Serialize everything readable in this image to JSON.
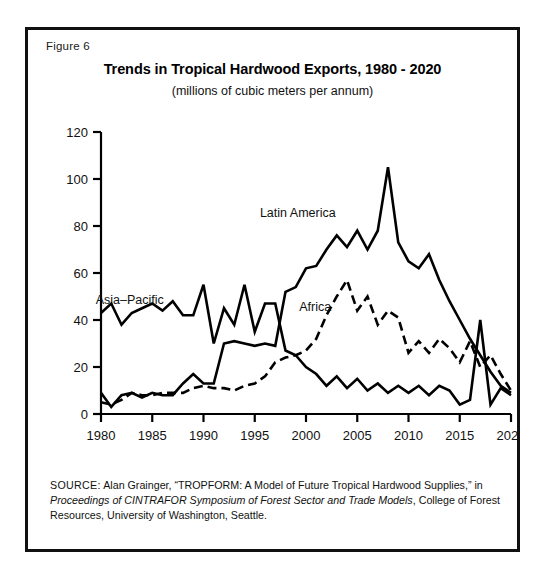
{
  "figure": {
    "number_label": "Figure 6"
  },
  "chart_data": {
    "type": "line",
    "title": "Trends in Tropical Hardwood Exports, 1980 - 2020",
    "subtitle": "(millions of cubic meters per annum)",
    "xlabel": "",
    "ylabel": "",
    "xlim": [
      1980,
      2020
    ],
    "ylim": [
      0,
      120
    ],
    "grid": false,
    "legend_position": "inline-annotations",
    "x_ticks": [
      "1980",
      "1985",
      "1990",
      "1995",
      "2000",
      "2005",
      "2010",
      "2015",
      "2020"
    ],
    "y_ticks": [
      "0",
      "20",
      "40",
      "60",
      "80",
      "100",
      "120"
    ],
    "x": [
      1980,
      1981,
      1982,
      1983,
      1984,
      1985,
      1986,
      1987,
      1988,
      1989,
      1990,
      1991,
      1992,
      1993,
      1994,
      1995,
      1996,
      1997,
      1998,
      1999,
      2000,
      2001,
      2002,
      2003,
      2004,
      2005,
      2006,
      2007,
      2008,
      2009,
      2010,
      2011,
      2012,
      2013,
      2014,
      2015,
      2016,
      2017,
      2018,
      2019,
      2020
    ],
    "series": [
      {
        "name": "Asia-Pacific",
        "label": "Asia–Pacific",
        "style": "solid",
        "values": [
          43,
          47,
          38,
          43,
          45,
          47,
          44,
          48,
          42,
          42,
          55,
          30,
          45,
          38,
          55,
          35,
          47,
          47,
          27,
          25,
          20,
          17,
          12,
          16,
          11,
          15,
          10,
          13,
          9,
          12,
          9,
          12,
          8,
          12,
          10,
          4,
          6,
          40,
          4,
          11,
          8
        ]
      },
      {
        "name": "Latin America",
        "label": "Latin America",
        "style": "solid",
        "values": [
          9,
          3,
          8,
          9,
          7,
          9,
          8,
          8,
          13,
          17,
          13,
          13,
          30,
          31,
          30,
          29,
          30,
          29,
          52,
          54,
          62,
          63,
          70,
          76,
          71,
          78,
          70,
          78,
          105,
          73,
          65,
          62,
          68,
          57,
          48,
          40,
          32,
          25,
          18,
          12,
          9
        ]
      },
      {
        "name": "Africa",
        "label": "Africa",
        "style": "dashed",
        "values": [
          5,
          4,
          6,
          9,
          8,
          8,
          9,
          9,
          9,
          11,
          12,
          11,
          11,
          10,
          12,
          13,
          16,
          22,
          24,
          25,
          27,
          32,
          42,
          50,
          57,
          44,
          50,
          38,
          44,
          41,
          26,
          31,
          26,
          32,
          28,
          22,
          31,
          20,
          25,
          17,
          10
        ]
      }
    ],
    "annotations": [
      {
        "text": "Asia–Pacific",
        "x": 1982.8,
        "y": 47
      },
      {
        "text": "Latin America",
        "x": 1999.2,
        "y": 84
      },
      {
        "text": "Africa",
        "x": 2000.9,
        "y": 44
      }
    ]
  },
  "source": {
    "label": "SOURCE:",
    "part1": "Alan Grainger, “TROPFORM:  A Model of Future Tropical Hardwood Supplies,” in",
    "italic": "Proceedings of CINTRAFOR Symposium of Forest Sector and Trade Models",
    "part2": ", College of Forest Resources, University of Washington, Seattle."
  }
}
